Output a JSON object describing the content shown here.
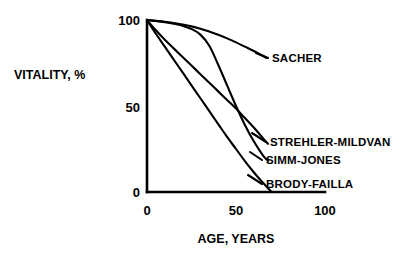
{
  "chart_data": {
    "type": "line",
    "title": "",
    "xlabel": "AGE, YEARS",
    "ylabel": "VITALITY, %",
    "xlim": [
      0,
      100
    ],
    "ylim": [
      0,
      100
    ],
    "xticks": [
      0,
      50,
      100
    ],
    "xtick_labels": [
      "0",
      "50",
      "100"
    ],
    "yticks": [
      0,
      50,
      100
    ],
    "ytick_labels": [
      "0",
      "50",
      "100"
    ],
    "grid": false,
    "legend_position": "right-of-curve-ends",
    "series": [
      {
        "name": "SACHER",
        "label": "SACHER",
        "color": "#000000",
        "x": [
          0,
          5,
          10,
          15,
          20,
          25,
          30,
          35,
          40,
          45,
          50,
          55,
          60,
          65,
          67
        ],
        "y": [
          100,
          99.5,
          99,
          98.3,
          97.4,
          96.3,
          94.9,
          93.3,
          91.4,
          89.3,
          87.0,
          84.5,
          82.0,
          79.2,
          78.0
        ]
      },
      {
        "name": "SIMM-JONES",
        "label": "SIMM-JONES",
        "color": "#000000",
        "x": [
          0,
          5,
          10,
          15,
          20,
          25,
          30,
          35,
          40,
          45,
          50,
          55,
          60,
          65,
          68
        ],
        "y": [
          100,
          99.4,
          98.7,
          97.8,
          96.6,
          94.8,
          91.5,
          85.0,
          74.0,
          62.0,
          50.0,
          39.0,
          29.5,
          21.5,
          18.0
        ]
      },
      {
        "name": "STREHLER-MILDVAN",
        "label": "STREHLER-MILDVAN",
        "color": "#000000",
        "x": [
          0,
          5,
          10,
          15,
          20,
          25,
          30,
          35,
          40,
          45,
          50,
          55,
          60,
          65,
          68
        ],
        "y": [
          100,
          94.0,
          88.5,
          83.5,
          78.5,
          73.5,
          68.5,
          63.5,
          58.5,
          53.5,
          48.5,
          43.0,
          37.5,
          31.5,
          28.0
        ]
      },
      {
        "name": "BRODY-FAILLA",
        "label": "BRODY-FAILLA",
        "color": "#000000",
        "x": [
          0,
          5,
          10,
          15,
          20,
          25,
          30,
          35,
          40,
          45,
          50,
          55,
          60,
          65,
          70
        ],
        "y": [
          100,
          92.0,
          84.5,
          77.0,
          69.5,
          62.0,
          54.5,
          47.0,
          39.5,
          32.0,
          25.0,
          18.0,
          11.5,
          5.5,
          0.0
        ]
      }
    ]
  },
  "axes": {
    "y_title": "VITALITY, %",
    "x_title": "AGE, YEARS",
    "y_tick_100": "100",
    "y_tick_50": "50",
    "y_tick_0": "0",
    "x_tick_0": "0",
    "x_tick_50": "50",
    "x_tick_100": "100"
  },
  "labels": {
    "sacher": "SACHER",
    "strehler_mildvan": "STREHLER-MILDVAN",
    "simm_jones": "SIMM-JONES",
    "brody_failla": "BRODY-FAILLA"
  },
  "colors": {
    "ink": "#000000",
    "paper": "#ffffff"
  }
}
